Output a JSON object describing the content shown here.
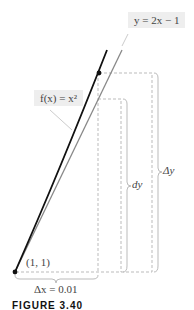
{
  "figure": {
    "caption": "FIGURE 3.40",
    "labels": {
      "tangent": "y = 2x − 1",
      "curve": "f(x) = x²",
      "point": "(1, 1)",
      "delta_x": "Δx = 0.01",
      "dy": "dy",
      "delta_y": "Δy"
    },
    "colors": {
      "curve": "#111111",
      "tangent": "#888888",
      "dashed": "#bbbbbb",
      "label_bg": "#eeeeee"
    }
  }
}
